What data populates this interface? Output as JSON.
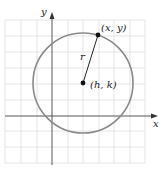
{
  "diagram": {
    "axes": {
      "x_label": "x",
      "y_label": "y"
    },
    "labels": {
      "point_on_circle": "(x, y)",
      "center": "(h, k)",
      "radius": "r"
    },
    "colors": {
      "grid": "#dcdcdc",
      "axis": "#444444",
      "circle": "#8a8a8a",
      "point": "#111111",
      "text": "#222222"
    }
  }
}
